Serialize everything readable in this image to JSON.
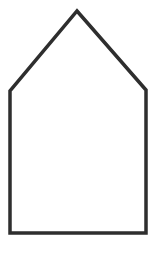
{
  "diagram": {
    "shape": "pentagon-house",
    "stroke_color": "#2e2e2e",
    "fill_color": "#ffffff",
    "stroke_width": 3.5,
    "vertices": [
      {
        "name": "apex",
        "x": 77,
        "y": 11
      },
      {
        "name": "right-shoulder",
        "x": 146,
        "y": 90
      },
      {
        "name": "bottom-right",
        "x": 146,
        "y": 233
      },
      {
        "name": "bottom-left",
        "x": 10,
        "y": 233
      },
      {
        "name": "left-shoulder",
        "x": 10,
        "y": 91
      }
    ]
  }
}
